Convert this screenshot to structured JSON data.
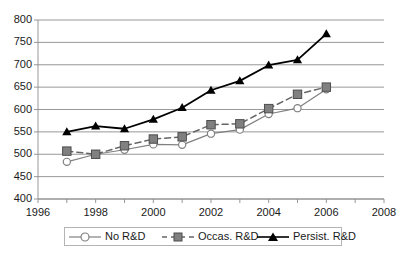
{
  "chart_data": {
    "type": "line",
    "title": "",
    "subtitle": "",
    "xlabel": "",
    "ylabel": "",
    "xlim": [
      1996,
      2008
    ],
    "ylim": [
      400,
      800
    ],
    "x_ticks": [
      1996,
      1998,
      2000,
      2002,
      2004,
      2006,
      2008
    ],
    "x_tick_labels": [
      "1996",
      "1998",
      "2000",
      "2002",
      "2004",
      "2006",
      "2008"
    ],
    "x_minor_ticks": [
      1997,
      1999,
      2001,
      2003,
      2005,
      2007
    ],
    "y_ticks": [
      400,
      450,
      500,
      550,
      600,
      650,
      700,
      750,
      800
    ],
    "y_tick_labels": [
      "400",
      "450",
      "500",
      "550",
      "600",
      "650",
      "700",
      "750",
      "800"
    ],
    "grid": "horizontal",
    "legend_position": "bottom",
    "x": [
      1997,
      1998,
      1999,
      2000,
      2001,
      2002,
      2003,
      2004,
      2005,
      2006
    ],
    "series": [
      {
        "name": "No R&D",
        "marker": "open-circle",
        "line_style": "solid",
        "color": "#808080",
        "values": [
          483,
          500,
          510,
          522,
          521,
          546,
          555,
          590,
          603,
          645
        ]
      },
      {
        "name": "Occas. R&D",
        "marker": "filled-square",
        "line_style": "dashed",
        "color": "#666666",
        "values": [
          507,
          500,
          519,
          534,
          539,
          566,
          568,
          602,
          634,
          650
        ]
      },
      {
        "name": "Persist. R&D",
        "marker": "filled-triangle",
        "line_style": "solid",
        "color": "#000000",
        "values": [
          550,
          563,
          557,
          578,
          604,
          643,
          664,
          699,
          711,
          769
        ]
      }
    ]
  },
  "legend": {
    "items": [
      {
        "label": "No R&D"
      },
      {
        "label": "Occas. R&D"
      },
      {
        "label": "Persist. R&D"
      }
    ]
  }
}
